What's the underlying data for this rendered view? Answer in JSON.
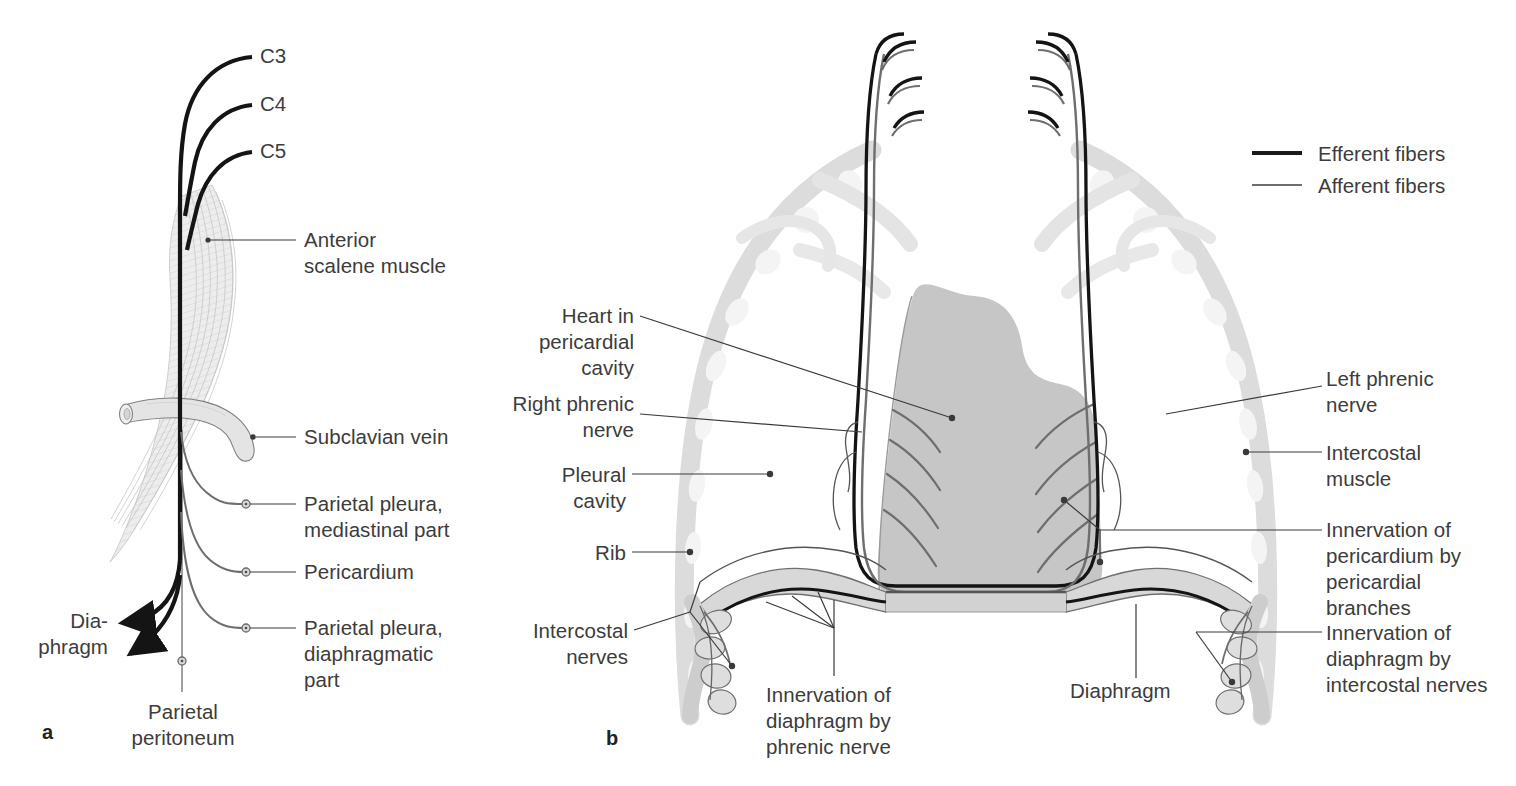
{
  "figure": {
    "colors": {
      "efferent": "#1a1a1a",
      "afferent": "#6e6e6e",
      "leader_line": "#3a3a3a",
      "text": "#3c3c3c",
      "heart_fill": "#c6c6c6",
      "rib_fill": "#dedede",
      "rib_highlight": "#f2f2f2",
      "muscle_fill": "#e8e8e8",
      "background": "#ffffff"
    }
  },
  "legend": {
    "items": [
      {
        "label": "Efferent fibers",
        "style": "thick-dark",
        "color": "#1a1a1a"
      },
      {
        "label": "Afferent fibers",
        "style": "thin-gray",
        "color": "#6e6e6e"
      }
    ]
  },
  "panel_a": {
    "letter": "a",
    "roots": [
      {
        "label": "C3"
      },
      {
        "label": "C4"
      },
      {
        "label": "C5"
      }
    ],
    "labels": {
      "anterior_scalene": "Anterior\nscalene muscle",
      "subclavian_vein": "Subclavian vein",
      "parietal_pleura_mediastinal": "Parietal pleura,\nmediastinal part",
      "pericardium": "Pericardium",
      "parietal_pleura_diaphragmatic": "Parietal pleura,\ndiaphragmatic\npart",
      "diaphragm": "Dia-\nphragm",
      "parietal_peritoneum": "Parietal\nperitoneum"
    }
  },
  "panel_b": {
    "letter": "b",
    "labels": {
      "heart_in_pericardial_cavity": "Heart in\npericardial\ncavity",
      "right_phrenic_nerve": "Right phrenic\nnerve",
      "pleural_cavity": "Pleural\ncavity",
      "rib": "Rib",
      "intercostal_nerves": "Intercostal\nnerves",
      "innervation_diaphragm_phrenic": "Innervation of\ndiaphragm by\nphrenic nerve",
      "diaphragm": "Diaphragm",
      "left_phrenic_nerve": "Left phrenic\nnerve",
      "intercostal_muscle": "Intercostal\nmuscle",
      "innervation_pericardium": "Innervation of\npericardium by\npericardial\nbranches",
      "innervation_diaphragm_intercostal": "Innervation of\ndiaphragm by\nintercostal nerves"
    }
  }
}
